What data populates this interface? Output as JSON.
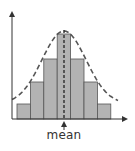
{
  "chart_data": {
    "type": "bar",
    "subtype": "histogram-with-normal-curve",
    "title": "",
    "xlabel": "",
    "ylabel": "",
    "categories": [
      "1",
      "2",
      "3",
      "4",
      "5",
      "6",
      "7"
    ],
    "values": [
      1,
      2.5,
      4,
      6,
      4,
      2.5,
      1
    ],
    "overlay": {
      "type": "dashed-bell-curve",
      "label": "normal distribution"
    },
    "annotations": [
      {
        "text": "mean",
        "position": "center",
        "style": "arrow pointing up to x-axis with vertical dashed line"
      }
    ],
    "grid": false,
    "legend": null
  },
  "diagram": {
    "mean_label": "mean",
    "colors": {
      "bar_fill": "#b3b3b3",
      "bar_stroke": "#555555",
      "axis": "#333333",
      "curve": "#555555",
      "mean_line": "#222222"
    },
    "geometry": {
      "origin_x": 12,
      "origin_y": 119,
      "axis_top": 10,
      "axis_right": 128,
      "bar_left": 17,
      "bar_width": 13.4,
      "bar_tops": [
        104,
        82,
        59,
        34,
        59,
        82,
        104
      ],
      "mean_x": 64
    }
  }
}
